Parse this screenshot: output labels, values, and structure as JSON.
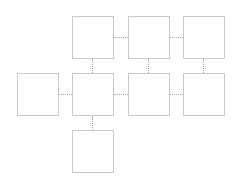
{
  "diagram": {
    "type": "grid-node-graph",
    "colors": {
      "node_border": "#c9c9c9",
      "node_fill": "#ffffff",
      "connector": "#a8a8a8",
      "background": "#ffffff"
    },
    "nodes": [
      {
        "id": "A",
        "row": 0,
        "col": 1,
        "label": ""
      },
      {
        "id": "B",
        "row": 0,
        "col": 2,
        "label": ""
      },
      {
        "id": "C",
        "row": 0,
        "col": 3,
        "label": ""
      },
      {
        "id": "D",
        "row": 1,
        "col": 0,
        "label": ""
      },
      {
        "id": "E",
        "row": 1,
        "col": 1,
        "label": ""
      },
      {
        "id": "F",
        "row": 1,
        "col": 2,
        "label": ""
      },
      {
        "id": "G",
        "row": 1,
        "col": 3,
        "label": ""
      },
      {
        "id": "H",
        "row": 2,
        "col": 1,
        "label": ""
      }
    ],
    "edges": [
      {
        "from": "A",
        "to": "B",
        "style": "dotted"
      },
      {
        "from": "B",
        "to": "C",
        "style": "dotted"
      },
      {
        "from": "D",
        "to": "E",
        "style": "dotted"
      },
      {
        "from": "E",
        "to": "F",
        "style": "dotted"
      },
      {
        "from": "F",
        "to": "G",
        "style": "dotted"
      },
      {
        "from": "A",
        "to": "E",
        "style": "dotted"
      },
      {
        "from": "B",
        "to": "F",
        "style": "dotted"
      },
      {
        "from": "C",
        "to": "G",
        "style": "dotted"
      },
      {
        "from": "E",
        "to": "H",
        "style": "dotted"
      }
    ]
  }
}
